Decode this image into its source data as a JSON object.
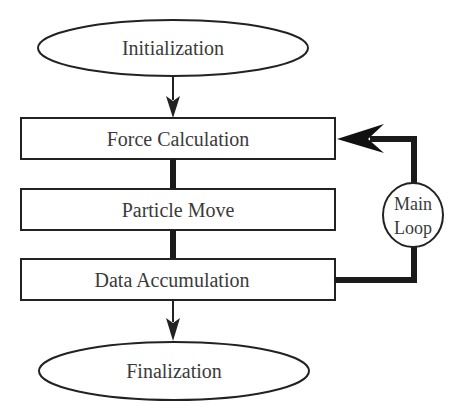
{
  "diagram": {
    "type": "flowchart",
    "colors": {
      "stroke": "#222222",
      "text": "#3a3a3a",
      "background": "#ffffff"
    },
    "nodes": {
      "initialization": {
        "label": "Initialization",
        "shape": "ellipse"
      },
      "force_calculation": {
        "label": "Force Calculation",
        "shape": "rectangle"
      },
      "particle_move": {
        "label": "Particle Move",
        "shape": "rectangle"
      },
      "data_accumulation": {
        "label": "Data Accumulation",
        "shape": "rectangle"
      },
      "main_loop": {
        "label_line1": "Main",
        "label_line2": "Loop",
        "shape": "ellipse"
      },
      "finalization": {
        "label": "Finalization",
        "shape": "ellipse"
      }
    },
    "edges": [
      {
        "from": "Initialization",
        "to": "Force Calculation",
        "style": "thin-arrow"
      },
      {
        "from": "Force Calculation",
        "to": "Particle Move",
        "style": "thick-line"
      },
      {
        "from": "Particle Move",
        "to": "Data Accumulation",
        "style": "thick-line"
      },
      {
        "from": "Data Accumulation",
        "to": "Main Loop",
        "style": "thick-line"
      },
      {
        "from": "Main Loop",
        "to": "Force Calculation",
        "style": "thick-arrow"
      },
      {
        "from": "Data Accumulation",
        "to": "Finalization",
        "style": "thin-arrow"
      }
    ]
  }
}
